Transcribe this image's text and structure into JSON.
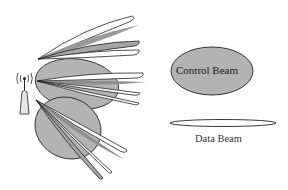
{
  "legend": {
    "control_beam": {
      "label": "Control Beam",
      "fill": "#b3b3b3",
      "stroke": "#222222"
    },
    "data_beam": {
      "label": "Data Beam",
      "fill": "#ffffff",
      "stroke": "#222222"
    }
  },
  "colors": {
    "background": "#ffffff",
    "beam_grey": "#9a9a9a",
    "beam_white": "#ffffff",
    "control_fill": "#b3b3b3",
    "outline": "#222222",
    "tower_fill": "#e6e6e6"
  },
  "icons": {
    "base_station": "antenna-tower-icon"
  }
}
